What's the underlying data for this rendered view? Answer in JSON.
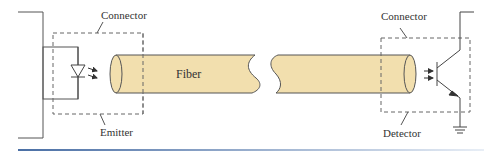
{
  "diagram": {
    "type": "fiber-optic-link",
    "labels": {
      "connector_left": "Connector",
      "connector_right": "Connector",
      "fiber": "Fiber",
      "emitter": "Emitter",
      "detector": "Detector"
    },
    "components": [
      {
        "id": "emitter",
        "symbol": "LED (diode with emitted-light arrows)"
      },
      {
        "id": "fiber",
        "symbol": "cylindrical fiber with break"
      },
      {
        "id": "detector",
        "symbol": "phototransistor with incoming-light arrows"
      },
      {
        "id": "ground",
        "symbol": "ground symbol"
      }
    ],
    "colors": {
      "fiber_fill": "#f2dfae",
      "stroke": "#555555",
      "dashed_box": "#666666",
      "rule_start": "#4a6fa5",
      "rule_end": "#e8eef6"
    }
  }
}
